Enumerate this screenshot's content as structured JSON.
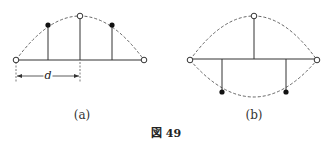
{
  "figure": {
    "caption": "図 49",
    "panels": [
      {
        "id": "a",
        "label": "(a)",
        "dimension_label": "d",
        "nodes": {
          "open": [
            [
              16,
              60
            ],
            [
              144,
              60
            ],
            [
              80,
              16
            ]
          ],
          "filled": [
            [
              48,
              25
            ],
            [
              112,
              25
            ]
          ]
        },
        "arc": "upper"
      },
      {
        "id": "b",
        "label": "(b)",
        "nodes": {
          "open": [
            [
              190,
              60
            ],
            [
              317,
              60
            ],
            [
              254,
              16
            ]
          ],
          "filled": [
            [
              222,
              92
            ],
            [
              286,
              92
            ]
          ]
        },
        "arc": "upper and lower"
      }
    ]
  },
  "colors": {
    "line": "#333333",
    "dash": "#555555",
    "background": "#ffffff"
  }
}
